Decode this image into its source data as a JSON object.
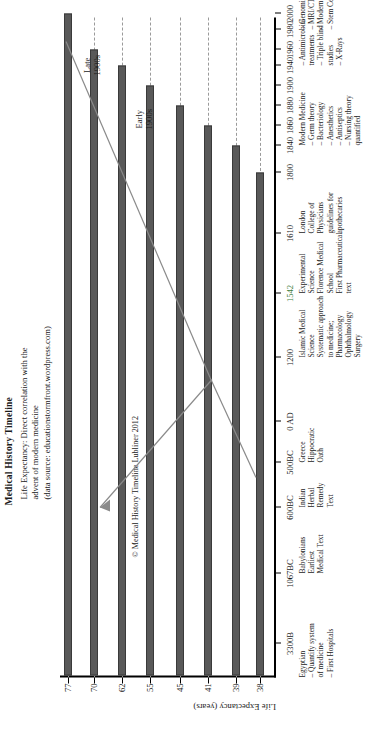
{
  "figure": {
    "title": "Medical History Timeline",
    "subtitle_lines": [
      "Life Expectancy: Direct correlation with the",
      "advent of modern medicine",
      "(data source: educationstormfront.wordpress.com)"
    ],
    "copyright": "© Medical History Timeline Lubliner 2012"
  },
  "chart_data": {
    "type": "bar",
    "title": "Medical History Timeline",
    "subtitle": "Life Expectancy: Direct correlation with the advent of modern medicine (data source: educationstormfront.wordpress.com)",
    "xlabel": "",
    "ylabel": "Life Expectancy (years)",
    "ylim": [
      0,
      80
    ],
    "grid": true,
    "legend": "none",
    "source": "educationstormfront.wordpress.com",
    "x_tick_labels": [
      "3300B",
      "1067BC",
      "600BC",
      "500BC",
      "0 AD",
      "1200",
      "1542",
      "1610",
      "1800",
      "1840",
      "1860",
      "1880",
      "1900",
      "1940",
      "1960",
      "1980",
      "2000"
    ],
    "y_tick_labels": [
      "38",
      "39",
      "41",
      "45",
      "55",
      "62",
      "70",
      "77"
    ],
    "y_tick_values": [
      38,
      39,
      41,
      45,
      55,
      62,
      70,
      77
    ],
    "categories": [
      "3300BC",
      "1067BC",
      "600BC",
      "500BC",
      "0 AD",
      "1200",
      "1542",
      "1610",
      "1800",
      "1840",
      "1860",
      "1880",
      "1900",
      "1940",
      "1960",
      "1980",
      "2000"
    ],
    "values": [
      38,
      38,
      39,
      39,
      41,
      41,
      41,
      41,
      45,
      45,
      55,
      55,
      62,
      62,
      70,
      70,
      77
    ],
    "bars": [
      {
        "year": "1800",
        "life_expectancy": 38
      },
      {
        "year": "1840",
        "life_expectancy": 39
      },
      {
        "year": "1860",
        "life_expectancy": 41
      },
      {
        "year": "1880",
        "life_expectancy": 45
      },
      {
        "year": "1900",
        "life_expectancy": 55
      },
      {
        "year": "1940",
        "life_expectancy": 62
      },
      {
        "year": "1960",
        "life_expectancy": 70
      },
      {
        "year": "1980",
        "life_expectancy": 77
      },
      {
        "year": "2000",
        "life_expectancy": 77
      }
    ],
    "annotations": [
      {
        "label": "Early 1900s"
      },
      {
        "label": "Late 1900s"
      }
    ],
    "highlighted_tick": "1542",
    "highlight_color": "#3c7d3c",
    "bar_color": "#595959",
    "grid_color": "#9a9a9a"
  },
  "axes": {
    "y_title": "Life Expectancy (years)",
    "y_ticks": [
      {
        "label": "77"
      },
      {
        "label": "70"
      },
      {
        "label": "62"
      },
      {
        "label": "55"
      },
      {
        "label": "45"
      },
      {
        "label": "41"
      },
      {
        "label": "39"
      },
      {
        "label": "38"
      }
    ],
    "x_ticks": [
      {
        "label": "3300B"
      },
      {
        "label": "1067BC"
      },
      {
        "label": "600BC"
      },
      {
        "label": "500BC"
      },
      {
        "label": "0 AD"
      },
      {
        "label": "1200"
      },
      {
        "label": "1542"
      },
      {
        "label": "1610"
      },
      {
        "label": "1800"
      },
      {
        "label": "1840"
      },
      {
        "label": "1860"
      },
      {
        "label": "1880"
      },
      {
        "label": "1900"
      },
      {
        "label": "1940"
      },
      {
        "label": "1960"
      },
      {
        "label": "1980"
      },
      {
        "label": "2000"
      }
    ]
  },
  "era_labels": {
    "early": [
      "Early",
      "1900s"
    ],
    "late": [
      "Late",
      "1900s"
    ]
  },
  "events": [
    {
      "anchor": "3300BC",
      "lines": [
        "Egyptian",
        "– Quantify system",
        "   of medicine",
        "– First Hospitals"
      ]
    },
    {
      "anchor": "1067BC",
      "lines": [
        "Babylonians",
        "Earliest",
        "Medical Text"
      ]
    },
    {
      "anchor": "600BC",
      "lines": [
        "Indian",
        "Herbal",
        "Remedy",
        "Text"
      ]
    },
    {
      "anchor": "500BC",
      "lines": [
        "Greece",
        "Hippocratic",
        "Oath"
      ]
    },
    {
      "anchor": "1200",
      "lines": [
        "Islamic Medical",
        "Science",
        "Systematic approach",
        "to medicine;",
        "Pharmacology",
        "Ophthalmology",
        "Surgery"
      ]
    },
    {
      "anchor": "1542",
      "lines": [
        "Experimental",
        "Science",
        "Florence Medical",
        "School",
        "First Pharmaceutical",
        "text"
      ]
    },
    {
      "anchor": "1610",
      "lines": [
        "London",
        "College of",
        "Physicians",
        "guidelines for",
        "apothecaries"
      ]
    },
    {
      "anchor": "1840",
      "lines": [
        "Modern Medicine",
        "– Germ theory",
        "– Bacteriology",
        "– Anesthetics",
        "– Antiseptics",
        "– Nursing theory",
        "   quantified"
      ]
    },
    {
      "anchor": "1940",
      "lines": [
        "– Antimicrobial",
        "   treatments",
        "– Triple blind",
        "   studies",
        "– X-Rays"
      ]
    },
    {
      "anchor": "1980",
      "lines": [
        "– Genomics",
        "– MRI/CT scans",
        "– Modern Surgery",
        "– Stem Cells"
      ]
    }
  ]
}
